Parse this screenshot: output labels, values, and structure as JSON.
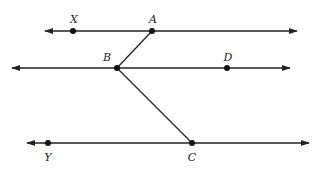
{
  "diagram": {
    "colors": {
      "stroke": "#222222",
      "point": "#111111",
      "background": "#ffffff"
    },
    "lines": [
      {
        "name": "line-XA",
        "x1": 45,
        "y1": 31,
        "x2": 297,
        "y2": 31,
        "arrows": "both"
      },
      {
        "name": "line-BD",
        "x1": 12,
        "y1": 68,
        "x2": 290,
        "y2": 68,
        "arrows": "both"
      },
      {
        "name": "line-YC",
        "x1": 27,
        "y1": 143,
        "x2": 309,
        "y2": 143,
        "arrows": "both"
      }
    ],
    "segments": [
      {
        "name": "segment-AB",
        "from": "A",
        "to": "B"
      },
      {
        "name": "segment-BC",
        "from": "B",
        "to": "C"
      }
    ],
    "points": {
      "X": {
        "label": "X",
        "x": 73,
        "y": 31,
        "lx": 74,
        "ly": 23
      },
      "A": {
        "label": "A",
        "x": 152,
        "y": 31,
        "lx": 153,
        "ly": 23
      },
      "B": {
        "label": "B",
        "x": 117,
        "y": 68,
        "lx": 107,
        "ly": 61
      },
      "D": {
        "label": "D",
        "x": 227,
        "y": 68,
        "lx": 228,
        "ly": 61
      },
      "Y": {
        "label": "Y",
        "x": 48,
        "y": 143,
        "lx": 48,
        "ly": 161
      },
      "C": {
        "label": "C",
        "x": 192,
        "y": 143,
        "lx": 192,
        "ly": 161
      }
    }
  }
}
